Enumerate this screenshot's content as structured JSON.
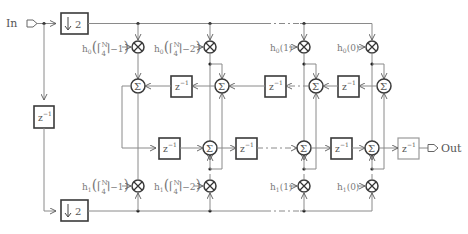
{
  "diagram": {
    "type": "polyphase FIR filter block diagram",
    "input_label": "In",
    "output_label": "Out",
    "downsampler_label": "2",
    "delay_label": "z",
    "delay_exponent": "−1",
    "adder_symbol": "Σ",
    "multiplier_symbol": "×",
    "top_coefficients": [
      {
        "name": "h0",
        "prefix": "h",
        "sub": "0",
        "arg": "⌈N/4⌉−1"
      },
      {
        "name": "h0",
        "prefix": "h",
        "sub": "0",
        "arg": "⌈N/4⌉−2"
      },
      {
        "name": "h0",
        "prefix": "h",
        "sub": "0",
        "arg": "1"
      },
      {
        "name": "h0",
        "prefix": "h",
        "sub": "0",
        "arg": "0"
      }
    ],
    "bottom_coefficients": [
      {
        "name": "h1",
        "prefix": "h",
        "sub": "1",
        "arg": "⌈N/4⌉−1"
      },
      {
        "name": "h1",
        "prefix": "h",
        "sub": "1",
        "arg": "⌈N/4⌉−2"
      },
      {
        "name": "h1",
        "prefix": "h",
        "sub": "1",
        "arg": "1"
      },
      {
        "name": "h1",
        "prefix": "h",
        "sub": "1",
        "arg": "0"
      }
    ],
    "frac_N": "N",
    "frac_4": "4",
    "minus1": "−1)",
    "minus2": "−2)",
    "arg1": "(1)",
    "arg0": "(0)"
  }
}
